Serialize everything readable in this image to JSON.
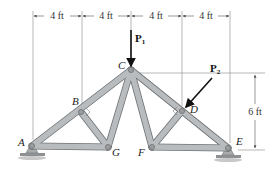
{
  "diagram": {
    "type": "truss",
    "colors": {
      "member_fill": "#b9bcbe",
      "member_stroke": "#6f7375",
      "pin": "#9a9c9e",
      "dimension": "#555555",
      "arrow": "#111111"
    },
    "joints": {
      "A": {
        "label": "A",
        "x": 32,
        "y": 146
      },
      "B": {
        "label": "B",
        "x": 81,
        "y": 112
      },
      "C": {
        "label": "C",
        "x": 131,
        "y": 70
      },
      "D": {
        "label": "D",
        "x": 182,
        "y": 111
      },
      "E": {
        "label": "E",
        "x": 228,
        "y": 148
      },
      "F": {
        "label": "F",
        "x": 152,
        "y": 147
      },
      "G": {
        "label": "G",
        "x": 108,
        "y": 147
      }
    },
    "members": [
      [
        "A",
        "B"
      ],
      [
        "B",
        "C"
      ],
      [
        "C",
        "D"
      ],
      [
        "D",
        "E"
      ],
      [
        "A",
        "G"
      ],
      [
        "G",
        "B"
      ],
      [
        "G",
        "C"
      ],
      [
        "C",
        "F"
      ],
      [
        "F",
        "D"
      ],
      [
        "F",
        "E"
      ]
    ],
    "dimensions": {
      "horizontal": [
        "4 ft",
        "4 ft",
        "4 ft",
        "4 ft"
      ],
      "vertical": "6 ft"
    },
    "loads": {
      "P1": {
        "label": "P",
        "sub": "1"
      },
      "P2": {
        "label": "P",
        "sub": "2"
      }
    }
  }
}
